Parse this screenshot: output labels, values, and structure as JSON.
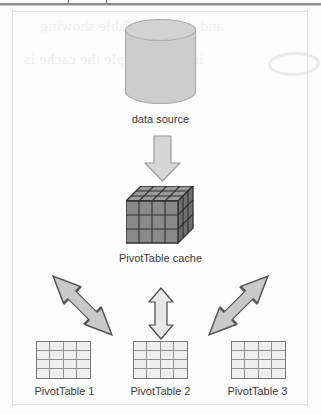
{
  "page": {
    "background_color": "#fdfdfd",
    "frame_border_color": "#e2e3e5"
  },
  "scan_artifacts": {
    "top_rule_color": "#8d8f91",
    "ghost_text_color": "#eceef0",
    "ghost_line_1": "and one PivotTable showing",
    "ghost_line_2": "in this example the cache is"
  },
  "diagram": {
    "type": "flow-diagram",
    "nodes": [
      {
        "id": "data-source",
        "shape": "cylinder",
        "label": "data source",
        "fill": "#cdcdcd",
        "stroke": "#a9a9a9"
      },
      {
        "id": "pivottable-cache",
        "shape": "cube",
        "label": "PivotTable cache",
        "fill": "#8a8a8a",
        "stroke": "#3a3a3a",
        "grid_columns": 4,
        "grid_rows": 3
      },
      {
        "id": "pivottable-1",
        "shape": "table-grid",
        "label": "PivotTable 1",
        "fill": "#efeff0",
        "stroke": "#8f9092",
        "grid_columns": 4,
        "grid_rows": 4
      },
      {
        "id": "pivottable-2",
        "shape": "table-grid",
        "label": "PivotTable 2",
        "fill": "#efeff0",
        "stroke": "#8f9092",
        "grid_columns": 4,
        "grid_rows": 4
      },
      {
        "id": "pivottable-3",
        "shape": "table-grid",
        "label": "PivotTable 3",
        "fill": "#efeff0",
        "stroke": "#8f9092",
        "grid_columns": 4,
        "grid_rows": 4
      }
    ],
    "arrows": [
      {
        "id": "arrow-source-to-cache",
        "from": "data-source",
        "to": "pivottable-cache",
        "direction": "down",
        "heads": 1,
        "fill": "#d6d6d6",
        "stroke": "#9a9a9a"
      },
      {
        "id": "arrow-cache-to-pivottable-1",
        "from": "pivottable-cache",
        "to": "pivottable-1",
        "direction": "diagonal-down-left",
        "heads": 2,
        "fill": "#c9c9c9",
        "stroke": "#555555"
      },
      {
        "id": "arrow-cache-to-pivottable-2",
        "from": "pivottable-cache",
        "to": "pivottable-2",
        "direction": "vertical",
        "heads": 2,
        "fill": "#e8e8e8",
        "stroke": "#4a4a4a"
      },
      {
        "id": "arrow-cache-to-pivottable-3",
        "from": "pivottable-cache",
        "to": "pivottable-3",
        "direction": "diagonal-down-right",
        "heads": 2,
        "fill": "#c9c9c9",
        "stroke": "#555555"
      }
    ],
    "labels": {
      "data_source": "data source",
      "pivottable_cache": "PivotTable cache",
      "pivottable_1": "PivotTable 1",
      "pivottable_2": "PivotTable 2",
      "pivottable_3": "PivotTable 3"
    }
  }
}
